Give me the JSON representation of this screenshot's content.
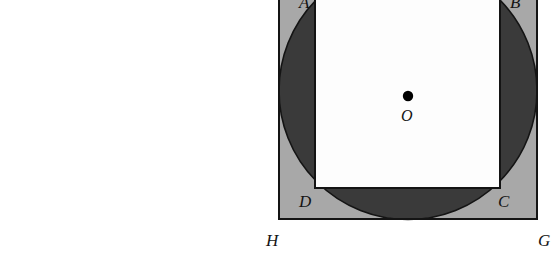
{
  "figure": {
    "kind": "geometry-diagram",
    "canvas": {
      "width": 554,
      "height": 280
    },
    "colors": {
      "background": "#ffffff",
      "outer_square_fill": "#a8a8a8",
      "circle_fill": "#3a3a3a",
      "inner_square_fill": "#fdfdfd",
      "stroke": "#141414",
      "label_color": "#141414",
      "center_dot": "#000000"
    },
    "outer_square": {
      "name": "ABGH-outer",
      "left": 279,
      "right": 537,
      "top": -38,
      "bottom": 219,
      "stroke_width": 2.2
    },
    "circle": {
      "name": "inscribed-circle",
      "cx": 408,
      "cy": 90.5,
      "r": 129,
      "stroke_width": 1.6
    },
    "inner_square": {
      "name": "ABCD-inner",
      "left": 315,
      "right": 500,
      "top": -30,
      "bottom": 188,
      "stroke_width": 2.0
    },
    "center_point": {
      "cx": 408,
      "cy": 96,
      "r": 5.2
    },
    "labels": [
      {
        "id": "A",
        "text": "A",
        "x": 299,
        "y": -6,
        "anchor": "start"
      },
      {
        "id": "B",
        "text": "B",
        "x": 510,
        "y": -6,
        "anchor": "start"
      },
      {
        "id": "D",
        "text": "D",
        "x": 299,
        "y": 193,
        "anchor": "start"
      },
      {
        "id": "C",
        "text": "C",
        "x": 498,
        "y": 193,
        "anchor": "start"
      },
      {
        "id": "O",
        "text": "O",
        "x": 401,
        "y": 108,
        "anchor": "start"
      },
      {
        "id": "H",
        "text": "H",
        "x": 266,
        "y": 232,
        "anchor": "start"
      },
      {
        "id": "G",
        "text": "G",
        "x": 538,
        "y": 232,
        "anchor": "start"
      }
    ]
  }
}
